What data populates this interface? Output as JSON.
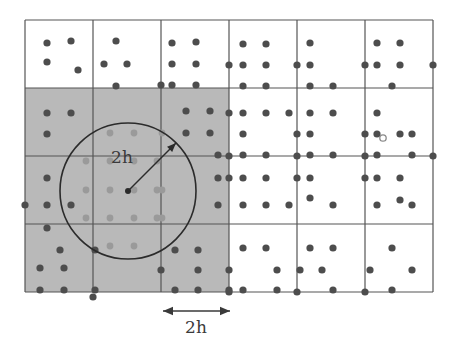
{
  "figure": {
    "background_color": "#ffffff",
    "grid_line_color": "#555555",
    "shaded_cell_color": "#b9b9b9",
    "particle_color": "#4d4d4d",
    "shaded_particle_color": "#9a9a9a",
    "circle_color": "#2b2b2b",
    "label_color": "#3a3a3a"
  },
  "labels": {
    "radius_label": "2h",
    "scale_label": "2h"
  },
  "grid": {
    "x0": 25,
    "y0": 20,
    "cell_size": 68,
    "cols": 6,
    "rows": 4,
    "x_lines": [
      25,
      93,
      161,
      229,
      297,
      365,
      433
    ],
    "y_lines": [
      20,
      88,
      156,
      224,
      292
    ],
    "shaded_cells": [
      {
        "col": 0,
        "row": 1
      },
      {
        "col": 1,
        "row": 1
      },
      {
        "col": 2,
        "row": 1
      },
      {
        "col": 0,
        "row": 2
      },
      {
        "col": 1,
        "row": 2
      },
      {
        "col": 2,
        "row": 2
      },
      {
        "col": 0,
        "row": 3
      },
      {
        "col": 1,
        "row": 3
      },
      {
        "col": 2,
        "row": 3
      }
    ]
  },
  "support_circle": {
    "center_x": 128,
    "center_y": 191,
    "radius": 68,
    "arrow_tip_x": 176,
    "arrow_tip_y": 143,
    "label": "2h",
    "label_x": 122,
    "label_y": 163
  },
  "scale_bar": {
    "x1": 163,
    "x2": 230,
    "y": 311,
    "label": "2h",
    "label_x": 196,
    "label_y": 333
  },
  "chart_data": {
    "type": "scatter",
    "xlabel": "",
    "ylabel": "",
    "xlim": [
      25,
      433
    ],
    "ylim": [
      20,
      292
    ],
    "grid": true,
    "legend": null,
    "annotations": [
      {
        "text": "2h",
        "x": 122,
        "y": 163,
        "note": "radius arrow label"
      },
      {
        "text": "2h",
        "x": 196,
        "y": 333,
        "note": "cell-size scale bar label"
      }
    ],
    "series": [
      {
        "name": "particles",
        "marker": "filled-circle",
        "color": "#4d4d4d",
        "radius": 3.6,
        "points": [
          [
            47,
            43
          ],
          [
            47,
            62
          ],
          [
            71,
            41
          ],
          [
            78,
            70
          ],
          [
            116,
            41
          ],
          [
            104,
            64
          ],
          [
            127,
            64
          ],
          [
            116,
            86
          ],
          [
            172,
            43
          ],
          [
            172,
            64
          ],
          [
            172,
            85
          ],
          [
            196,
            42
          ],
          [
            196,
            64
          ],
          [
            196,
            85
          ],
          [
            161,
            85
          ],
          [
            243,
            44
          ],
          [
            266,
            44
          ],
          [
            243,
            65
          ],
          [
            266,
            65
          ],
          [
            243,
            86
          ],
          [
            266,
            86
          ],
          [
            229,
            65
          ],
          [
            310,
            43
          ],
          [
            310,
            65
          ],
          [
            310,
            86
          ],
          [
            333,
            86
          ],
          [
            297,
            65
          ],
          [
            377,
            43
          ],
          [
            400,
            43
          ],
          [
            377,
            65
          ],
          [
            400,
            65
          ],
          [
            392,
            86
          ],
          [
            365,
            65
          ],
          [
            433,
            65
          ],
          [
            47,
            113
          ],
          [
            47,
            134
          ],
          [
            71,
            113
          ],
          [
            186,
            111
          ],
          [
            210,
            111
          ],
          [
            186,
            133
          ],
          [
            210,
            133
          ],
          [
            243,
            113
          ],
          [
            266,
            113
          ],
          [
            289,
            113
          ],
          [
            229,
            113
          ],
          [
            243,
            134
          ],
          [
            243,
            155
          ],
          [
            266,
            155
          ],
          [
            310,
            113
          ],
          [
            333,
            113
          ],
          [
            310,
            134
          ],
          [
            310,
            155
          ],
          [
            333,
            155
          ],
          [
            297,
            134
          ],
          [
            377,
            113
          ],
          [
            377,
            134
          ],
          [
            400,
            134
          ],
          [
            377,
            155
          ],
          [
            412,
            134
          ],
          [
            412,
            155
          ],
          [
            365,
            134
          ],
          [
            229,
            156
          ],
          [
            297,
            156
          ],
          [
            365,
            156
          ],
          [
            433,
            156
          ],
          [
            47,
            178
          ],
          [
            47,
            205
          ],
          [
            71,
            205
          ],
          [
            25,
            205
          ],
          [
            47,
            228
          ],
          [
            218,
            155
          ],
          [
            218,
            178
          ],
          [
            218,
            205
          ],
          [
            243,
            178
          ],
          [
            266,
            178
          ],
          [
            243,
            205
          ],
          [
            266,
            205
          ],
          [
            310,
            178
          ],
          [
            310,
            198
          ],
          [
            289,
            205
          ],
          [
            333,
            205
          ],
          [
            377,
            178
          ],
          [
            400,
            200
          ],
          [
            377,
            205
          ],
          [
            412,
            205
          ],
          [
            400,
            178
          ],
          [
            229,
            178
          ],
          [
            297,
            178
          ],
          [
            365,
            178
          ],
          [
            60,
            250
          ],
          [
            40,
            268
          ],
          [
            64,
            268
          ],
          [
            40,
            290
          ],
          [
            64,
            290
          ],
          [
            95,
            250
          ],
          [
            95,
            290
          ],
          [
            93,
            297
          ],
          [
            175,
            250
          ],
          [
            198,
            250
          ],
          [
            198,
            270
          ],
          [
            175,
            290
          ],
          [
            198,
            290
          ],
          [
            161,
            270
          ],
          [
            243,
            248
          ],
          [
            266,
            248
          ],
          [
            277,
            270
          ],
          [
            243,
            290
          ],
          [
            277,
            290
          ],
          [
            229,
            270
          ],
          [
            229,
            290
          ],
          [
            310,
            248
          ],
          [
            333,
            248
          ],
          [
            300,
            270
          ],
          [
            322,
            270
          ],
          [
            333,
            290
          ],
          [
            392,
            248
          ],
          [
            370,
            270
          ],
          [
            412,
            270
          ],
          [
            392,
            290
          ],
          [
            229,
            292
          ],
          [
            297,
            292
          ],
          [
            365,
            292
          ]
        ]
      },
      {
        "name": "particles-inside-support",
        "marker": "filled-circle",
        "color": "#9a9a9a",
        "radius": 3.4,
        "points": [
          [
            110,
            133
          ],
          [
            134,
            133
          ],
          [
            86,
            161
          ],
          [
            110,
            161
          ],
          [
            134,
            161
          ],
          [
            157,
            161
          ],
          [
            86,
            190
          ],
          [
            110,
            190
          ],
          [
            134,
            190
          ],
          [
            157,
            190
          ],
          [
            86,
            218
          ],
          [
            110,
            218
          ],
          [
            134,
            218
          ],
          [
            157,
            218
          ],
          [
            110,
            246
          ],
          [
            134,
            246
          ],
          [
            162,
            133
          ],
          [
            162,
            190
          ],
          [
            162,
            218
          ]
        ]
      },
      {
        "name": "highlighted-open-particle",
        "marker": "open-circle",
        "color": "#8a8a8a",
        "radius": 3.2,
        "points": [
          [
            383,
            138
          ]
        ]
      },
      {
        "name": "support-circle-center",
        "marker": "filled-circle",
        "color": "#2b2b2b",
        "radius": 3.0,
        "points": [
          [
            128,
            191
          ]
        ]
      }
    ]
  }
}
